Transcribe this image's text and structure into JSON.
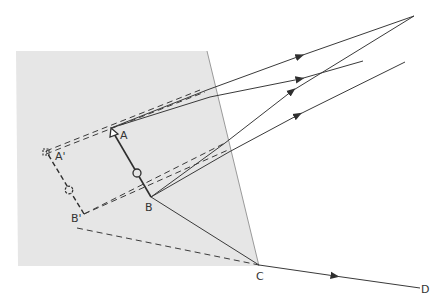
{
  "diagram": {
    "colors": {
      "background": "#ffffff",
      "mirror_panel": "#e6e6e6",
      "mirror_edge": "#9a9a9a",
      "line": "#3a3a3a",
      "text": "#333333"
    },
    "labels": {
      "A": "A",
      "B": "B",
      "A_prime": "A'",
      "B_prime": "B'",
      "C": "C",
      "D": "D"
    },
    "points": {
      "A": [
        111,
        128
      ],
      "B": [
        151,
        197
      ],
      "A_prime": [
        46,
        151
      ],
      "B_prime": [
        84,
        214
      ],
      "C": [
        259,
        265
      ],
      "D": [
        418,
        289
      ],
      "convergence": [
        414,
        16
      ]
    }
  }
}
